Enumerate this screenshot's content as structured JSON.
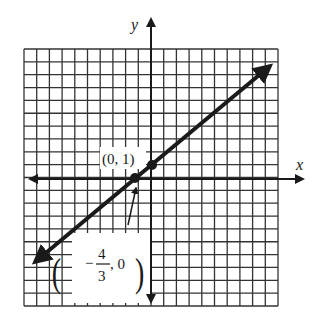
{
  "chart_data": {
    "type": "line",
    "title": "",
    "xlabel": "x",
    "ylabel": "y",
    "grid": true,
    "xlim": [
      -10,
      10
    ],
    "ylim": [
      -10,
      10
    ],
    "series": [
      {
        "name": "line",
        "equation": "y = (3/4)x + 1",
        "slope": 0.75,
        "intercept": 1,
        "x": [
          -9.3,
          9.8
        ],
        "y": [
          -5.975,
          8.35
        ]
      }
    ],
    "points": [
      {
        "label": "(0, 1)",
        "x": 0,
        "y": 1
      },
      {
        "label": "(-4/3, 0)",
        "x": -1.3333,
        "y": 0
      }
    ],
    "annotations": [
      "(0, 1)",
      "(-4/3, 0)"
    ]
  },
  "labels": {
    "x_axis": "x",
    "y_axis": "y",
    "point_a": "(0, 1)",
    "point_b_minus": "−",
    "point_b_num": "4",
    "point_b_den": "3",
    "point_b_rest": ", 0"
  }
}
